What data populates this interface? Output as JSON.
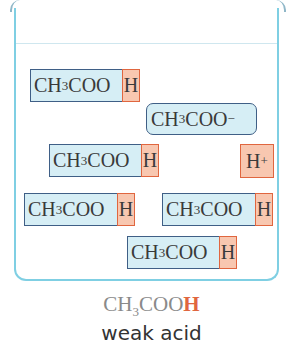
{
  "beaker": {
    "border_color": "#7fcfe3",
    "molecules": [
      {
        "formula_main": "CH",
        "formula_sub": "3",
        "formula_rest": "COO",
        "acidic_h": "H"
      },
      {
        "formula_main": "CH",
        "formula_sub": "3",
        "formula_rest": "COO",
        "acidic_h": "H"
      },
      {
        "formula_main": "CH",
        "formula_sub": "3",
        "formula_rest": "COO",
        "acidic_h": "H"
      },
      {
        "formula_main": "CH",
        "formula_sub": "3",
        "formula_rest": "COO",
        "acidic_h": "H"
      },
      {
        "formula_main": "CH",
        "formula_sub": "3",
        "formula_rest": "COO",
        "acidic_h": "H"
      }
    ],
    "ion": {
      "formula_main": "CH",
      "formula_sub": "3",
      "formula_rest": "COO",
      "charge": "−"
    },
    "proton": {
      "symbol": "H",
      "charge": "+"
    }
  },
  "caption": {
    "formula_main": "CH",
    "formula_sub": "3",
    "formula_rest": "COO",
    "acidic_h": "H",
    "label": "weak acid"
  },
  "colors": {
    "molecule_fill": "#d6eef5",
    "molecule_border": "#3f5f86",
    "hydrogen_fill": "#f8c7b0",
    "hydrogen_border": "#e0663f"
  }
}
